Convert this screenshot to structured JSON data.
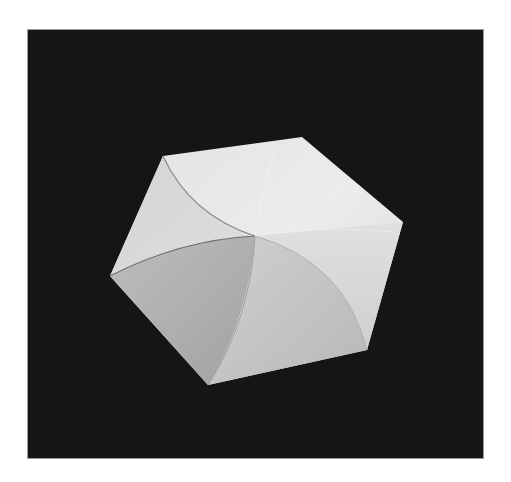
{
  "image": {
    "description": "Photograph of a folded white paper hexagon with a twist fold (curved pleats spiraling to the center) on a black background",
    "background_color": "#151515",
    "page_color": "#ffffff",
    "frame": {
      "x": 28,
      "y": 30,
      "width": 455,
      "height": 428
    },
    "hexagon": {
      "center": [
        255,
        236
      ],
      "vertices": [
        [
          163,
          156
        ],
        [
          302,
          137
        ],
        [
          403,
          222
        ],
        [
          367,
          350
        ],
        [
          208,
          385
        ],
        [
          110,
          276
        ]
      ],
      "face_colors": {
        "top": "#e4e4e4",
        "top_left": "#d6d6d6",
        "right": "#dcdcdc",
        "bottom_center": "#c4c4c4",
        "bottom_left": "#acacac"
      }
    }
  }
}
